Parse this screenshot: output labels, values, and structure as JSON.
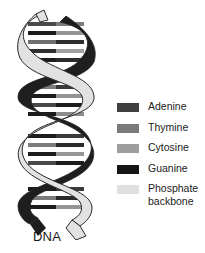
{
  "diagram": {
    "caption": "DNA",
    "helix": {
      "strand_dark_color": "#1e1e1e",
      "strand_light_color": "#e2e2e2",
      "outline_color": "#2a2a2a",
      "rungs": [
        {
          "y": 22,
          "left": "#4a4a4a",
          "right": "#7c7c7c"
        },
        {
          "y": 31,
          "left": "#1c1c1c",
          "right": "#959595"
        },
        {
          "y": 40,
          "left": "#6e6e6e",
          "right": "#2e2e2e"
        },
        {
          "y": 49,
          "left": "#303030",
          "right": "#a0a0a0"
        },
        {
          "y": 58,
          "left": "#1c1c1c",
          "right": "#2a2a2a"
        },
        {
          "y": 85,
          "left": "#7c7c7c",
          "right": "#3a3a3a"
        },
        {
          "y": 94,
          "left": "#1c1c1c",
          "right": "#959595"
        },
        {
          "y": 103,
          "left": "#4a4a4a",
          "right": "#1c1c1c"
        },
        {
          "y": 112,
          "left": "#1c1c1c",
          "right": "#8c8c8c"
        },
        {
          "y": 134,
          "left": "#1c1c1c",
          "right": "#3a3a3a"
        },
        {
          "y": 143,
          "left": "#7c7c7c",
          "right": "#2a2a2a"
        },
        {
          "y": 152,
          "left": "#1c1c1c",
          "right": "#959595"
        },
        {
          "y": 161,
          "left": "#4a4a4a",
          "right": "#1c1c1c"
        },
        {
          "y": 187,
          "left": "#1c1c1c",
          "right": "#3a3a3a"
        },
        {
          "y": 196,
          "left": "#7c7c7c",
          "right": "#2a2a2a"
        },
        {
          "y": 205,
          "left": "#1c1c1c",
          "right": "#959595"
        }
      ]
    },
    "legend": {
      "items": [
        {
          "label": "Adenine",
          "color": "#3f3f3f"
        },
        {
          "label": "Thymine",
          "color": "#7b7b7b"
        },
        {
          "label": "Cytosine",
          "color": "#9e9e9e"
        },
        {
          "label": "Guanine",
          "color": "#151515"
        },
        {
          "label": "Phosphate backbone",
          "line1": "Phosphate",
          "line2": "backbone",
          "color": "#e0e0e0"
        }
      ]
    }
  }
}
